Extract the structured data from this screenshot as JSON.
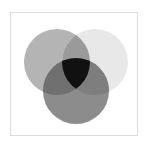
{
  "diagram": {
    "type": "venn",
    "sets": [
      {
        "id": "left",
        "cx": 57,
        "cy": 62,
        "r": 33,
        "color": "#b4b4b4"
      },
      {
        "id": "right",
        "cx": 95,
        "cy": 62,
        "r": 33,
        "color": "#e8e8e8"
      },
      {
        "id": "bottom",
        "cx": 76,
        "cy": 91,
        "r": 33,
        "color": "#8c8c8c"
      }
    ],
    "overlaps": {
      "left_right": "#9a9a9a",
      "left_bottom": "#707070",
      "right_bottom": "#7e7e7e",
      "all_three": "#111111"
    },
    "frame_border_color": "#dcdcdc"
  }
}
